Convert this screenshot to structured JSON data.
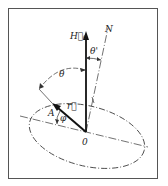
{
  "figure": {
    "type": "vector-geometry-diagram",
    "labels": {
      "field_vector": "H⃗₀",
      "normal": "N",
      "theta_prime": "θ'",
      "theta": "θ",
      "r_vector": "r⃗",
      "point_A": "A",
      "phi": "φ",
      "origin": "0"
    },
    "colors": {
      "ink": "#222222",
      "frame": "#555555",
      "background": "#ffffff"
    }
  }
}
